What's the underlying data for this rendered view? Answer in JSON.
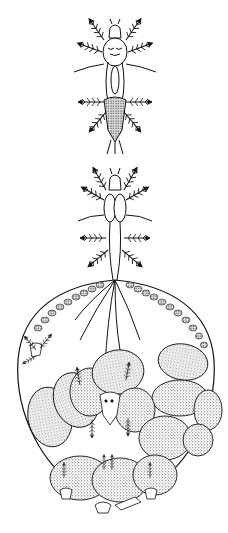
{
  "figure": {
    "panels": [
      {
        "id": "top-specimen",
        "subject": "free-living adult with plumose setae on appendages"
      },
      {
        "id": "bottom-specimen",
        "subject": "gravid female with swollen egg sac containing stippled eggs and hatching nauplii"
      }
    ],
    "colors": {
      "ink": "#111111",
      "paper": "#ffffff",
      "stipple": "#333333"
    }
  }
}
